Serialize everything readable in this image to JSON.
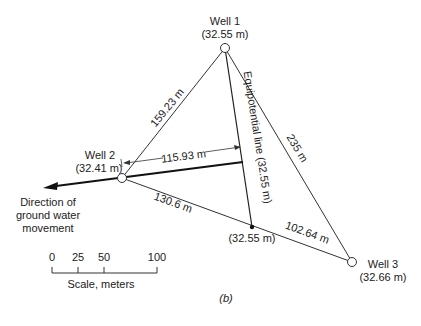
{
  "figure": {
    "label": "(b)",
    "wells": [
      {
        "name": "Well 1",
        "head": "(32.55 m)"
      },
      {
        "name": "Well 2",
        "head": "(32.41 m)"
      },
      {
        "name": "Well 3",
        "head": "(32.66 m)"
      }
    ],
    "distances": {
      "well1_well2": "159.23 m",
      "well1_well3": "235 m",
      "well2_point": "130.6 m",
      "point_well3": "102.64 m",
      "well2_to_equipotential": "115.93 m"
    },
    "equipotential": {
      "label": "Equipotential line (32.55 m)",
      "point_head": "(32.55 m)"
    },
    "flow": {
      "line1": "Direction of",
      "line2": "ground water",
      "line3": "movement"
    },
    "scale": {
      "ticks": [
        "0",
        "25",
        "50",
        "100"
      ],
      "label": "Scale, meters"
    }
  }
}
